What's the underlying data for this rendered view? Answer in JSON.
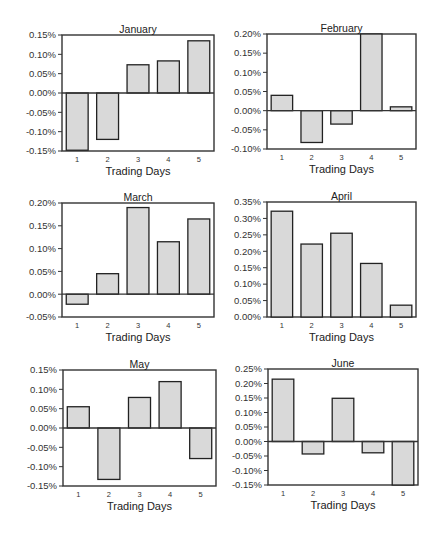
{
  "figure": {
    "bar_fill": "#d9d9d9",
    "bar_stroke": "#222222",
    "frame_stroke": "#333333",
    "background": "#ffffff"
  },
  "chart_data": [
    {
      "type": "bar",
      "title": "January",
      "xlabel": "Trading Days",
      "ylabel": "",
      "categories": [
        "1",
        "2",
        "3",
        "4",
        "5"
      ],
      "values": [
        -0.148,
        -0.12,
        0.073,
        0.083,
        0.135
      ],
      "unit": "%",
      "ylim": [
        -0.15,
        0.15
      ],
      "yticks": [
        "0.15%",
        "0.10%",
        "0.05%",
        "0.00%",
        "-0.05%",
        "-0.10%",
        "-0.15%"
      ],
      "ytick_values": [
        0.15,
        0.1,
        0.05,
        0.0,
        -0.05,
        -0.1,
        -0.15
      ],
      "grid": false,
      "frame": {
        "x": 62,
        "y": 35,
        "w": 152,
        "h": 116
      }
    },
    {
      "type": "bar",
      "title": "February",
      "xlabel": "Trading Days",
      "ylabel": "",
      "categories": [
        "1",
        "2",
        "3",
        "4",
        "5"
      ],
      "values": [
        0.04,
        -0.083,
        -0.035,
        0.2,
        0.01
      ],
      "unit": "%",
      "ylim": [
        -0.1,
        0.2
      ],
      "yticks": [
        "0.20%",
        "0.15%",
        "0.10%",
        "0.05%",
        "0.00%",
        "-0.05%",
        "-0.10%"
      ],
      "ytick_values": [
        0.2,
        0.15,
        0.1,
        0.05,
        0.0,
        -0.05,
        -0.1
      ],
      "grid": false,
      "frame": {
        "x": 267,
        "y": 34,
        "w": 149,
        "h": 115
      }
    },
    {
      "type": "bar",
      "title": "March",
      "xlabel": "Trading Days",
      "ylabel": "",
      "categories": [
        "1",
        "2",
        "3",
        "4",
        "5"
      ],
      "values": [
        -0.022,
        0.045,
        0.19,
        0.115,
        0.165
      ],
      "unit": "%",
      "ylim": [
        -0.05,
        0.2
      ],
      "yticks": [
        "0.20%",
        "0.15%",
        "0.10%",
        "0.05%",
        "0.00%",
        "-0.05%"
      ],
      "ytick_values": [
        0.2,
        0.15,
        0.1,
        0.05,
        0.0,
        -0.05
      ],
      "grid": false,
      "frame": {
        "x": 62,
        "y": 203,
        "w": 152,
        "h": 114
      }
    },
    {
      "type": "bar",
      "title": "April",
      "xlabel": "Trading Days",
      "ylabel": "",
      "categories": [
        "1",
        "2",
        "3",
        "4",
        "5"
      ],
      "values": [
        0.322,
        0.222,
        0.255,
        0.163,
        0.036
      ],
      "unit": "%",
      "ylim": [
        0.0,
        0.35
      ],
      "yticks": [
        "0.35%",
        "0.30%",
        "0.25%",
        "0.20%",
        "0.15%",
        "0.10%",
        "0.05%",
        "0.00%"
      ],
      "ytick_values": [
        0.35,
        0.3,
        0.25,
        0.2,
        0.15,
        0.1,
        0.05,
        0.0
      ],
      "grid": false,
      "frame": {
        "x": 267,
        "y": 202,
        "w": 149,
        "h": 115
      }
    },
    {
      "type": "bar",
      "title": "May",
      "xlabel": "Trading Days",
      "ylabel": "",
      "categories": [
        "1",
        "2",
        "3",
        "4",
        "5"
      ],
      "values": [
        0.055,
        -0.133,
        0.079,
        0.12,
        -0.079
      ],
      "unit": "%",
      "ylim": [
        -0.15,
        0.15
      ],
      "yticks": [
        "0.15%",
        "0.10%",
        "0.05%",
        "0.00%",
        "-0.05%",
        "-0.10%",
        "-0.15%"
      ],
      "ytick_values": [
        0.15,
        0.1,
        0.05,
        0.0,
        -0.05,
        -0.1,
        -0.15
      ],
      "grid": false,
      "frame": {
        "x": 63,
        "y": 370,
        "w": 153,
        "h": 116
      }
    },
    {
      "type": "bar",
      "title": "June",
      "xlabel": "Trading Days",
      "ylabel": "",
      "categories": [
        "1",
        "2",
        "3",
        "4",
        "5"
      ],
      "values": [
        0.215,
        -0.043,
        0.149,
        -0.039,
        -0.15
      ],
      "unit": "%",
      "ylim": [
        -0.15,
        0.25
      ],
      "yticks": [
        "0.25%",
        "0.20%",
        "0.15%",
        "0.10%",
        "0.05%",
        "0.00%",
        "-0.05%",
        "-0.10%",
        "-0.15%"
      ],
      "ytick_values": [
        0.25,
        0.2,
        0.15,
        0.1,
        0.05,
        0.0,
        -0.05,
        -0.1,
        -0.15
      ],
      "grid": false,
      "frame": {
        "x": 268,
        "y": 369,
        "w": 150,
        "h": 116
      }
    }
  ]
}
